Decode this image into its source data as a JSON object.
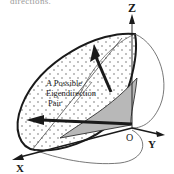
{
  "caption_fragment": "directions.",
  "diagram": {
    "axes": {
      "z_label": "Z",
      "y_label": "Y",
      "x_label": "X",
      "origin_label": "O"
    },
    "annotation": {
      "line1": "A Possible",
      "line2": "Eigendirection",
      "line3": "Pair"
    },
    "colors": {
      "stroke": "#1a1a1a",
      "shaded_region": "#b8b8b8",
      "dots": "#555555",
      "background": "#ffffff"
    }
  }
}
